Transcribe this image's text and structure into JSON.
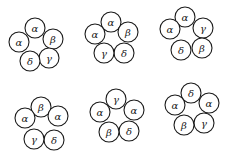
{
  "diagram": {
    "radius": 10,
    "stroke_color": "#1a1a1a",
    "clusters": [
      {
        "id": "arrangement-1",
        "subunits": [
          {
            "label": "α",
            "cx": 35,
            "cy": 28
          },
          {
            "label": "β",
            "cx": 53,
            "cy": 39
          },
          {
            "label": "γ",
            "cx": 49,
            "cy": 58
          },
          {
            "label": "δ",
            "cx": 30,
            "cy": 61
          },
          {
            "label": "α",
            "cx": 19,
            "cy": 42
          }
        ]
      },
      {
        "id": "arrangement-2",
        "subunits": [
          {
            "label": "α",
            "cx": 111,
            "cy": 22
          },
          {
            "label": "β",
            "cx": 128,
            "cy": 32
          },
          {
            "label": "δ",
            "cx": 124,
            "cy": 53
          },
          {
            "label": "γ",
            "cx": 104,
            "cy": 53
          },
          {
            "label": "α",
            "cx": 95,
            "cy": 34
          }
        ]
      },
      {
        "id": "arrangement-3",
        "subunits": [
          {
            "label": "α",
            "cx": 185,
            "cy": 17
          },
          {
            "label": "γ",
            "cx": 203,
            "cy": 28
          },
          {
            "label": "β",
            "cx": 202,
            "cy": 48
          },
          {
            "label": "δ",
            "cx": 181,
            "cy": 50
          },
          {
            "label": "α",
            "cx": 170,
            "cy": 29
          }
        ]
      },
      {
        "id": "arrangement-4",
        "subunits": [
          {
            "label": "β",
            "cx": 41,
            "cy": 107
          },
          {
            "label": "α",
            "cx": 58,
            "cy": 116
          },
          {
            "label": "δ",
            "cx": 54,
            "cy": 140
          },
          {
            "label": "γ",
            "cx": 34,
            "cy": 139
          },
          {
            "label": "α",
            "cx": 25,
            "cy": 118
          }
        ]
      },
      {
        "id": "arrangement-5",
        "subunits": [
          {
            "label": "γ",
            "cx": 116,
            "cy": 99
          },
          {
            "label": "α",
            "cx": 134,
            "cy": 110
          },
          {
            "label": "δ",
            "cx": 129,
            "cy": 131
          },
          {
            "label": "β",
            "cx": 109,
            "cy": 132
          },
          {
            "label": "α",
            "cx": 100,
            "cy": 112
          }
        ]
      },
      {
        "id": "arrangement-6",
        "subunits": [
          {
            "label": "δ",
            "cx": 191,
            "cy": 93
          },
          {
            "label": "α",
            "cx": 209,
            "cy": 103
          },
          {
            "label": "γ",
            "cx": 204,
            "cy": 123
          },
          {
            "label": "β",
            "cx": 184,
            "cy": 125
          },
          {
            "label": "α",
            "cx": 175,
            "cy": 105
          }
        ]
      }
    ]
  }
}
